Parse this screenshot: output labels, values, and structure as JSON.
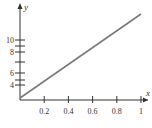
{
  "chart_data": {
    "type": "line",
    "title": "",
    "xlabel": "x",
    "ylabel": "y",
    "xlim": [
      0,
      1.05
    ],
    "x_ticks": [
      {
        "value": 0.2,
        "label": "0.2"
      },
      {
        "value": 0.4,
        "label": "0.4"
      },
      {
        "value": 0.6,
        "label": "0.6"
      },
      {
        "value": 0.8,
        "label": "0.8"
      },
      {
        "value": 1,
        "label": "1"
      }
    ],
    "y_ticks": [
      {
        "value": 4,
        "label": "4"
      },
      {
        "value": 5,
        "label": ""
      },
      {
        "value": 6,
        "label": "6"
      },
      {
        "value": 7,
        "label": ""
      },
      {
        "value": 8,
        "label": "8"
      },
      {
        "value": 9,
        "label": ""
      },
      {
        "value": 10,
        "label": "10"
      }
    ],
    "grid": false,
    "series": [
      {
        "name": "y",
        "x": [
          0,
          1
        ],
        "y": [
          0,
          12.5
        ],
        "color": "#7a7a7a"
      }
    ]
  }
}
